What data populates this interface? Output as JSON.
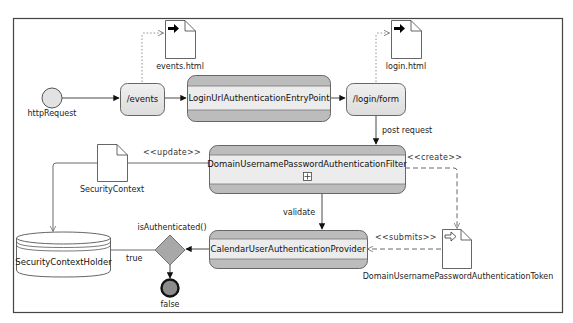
{
  "diagram": {
    "type": "UML activity diagram",
    "colors": {
      "frame": "#444444",
      "node_fill": "#e6e6e6",
      "band_fill": "#b8b8b8",
      "node_stroke": "#666666",
      "edge": "#333333",
      "decision_fill": "#a8a8a8",
      "final_fill": "#8c8c8c",
      "initial_fill": "#e0e0e0"
    },
    "nodes": {
      "initial": {
        "label": "httpRequest"
      },
      "events": {
        "label": "/events"
      },
      "entry_point": {
        "label": "LoginUrlAuthenticationEntryPoint"
      },
      "login_form": {
        "label": "/login/form"
      },
      "events_html": {
        "label": "events.html",
        "icon": "file-arrow-icon"
      },
      "login_html": {
        "label": "login.html",
        "icon": "file-arrow-icon"
      },
      "filter": {
        "label": "DomainUsernamePasswordAuthenticationFilter",
        "expand_icon": "plus-box-icon"
      },
      "security_context": {
        "label": "SecurityContext",
        "icon": "file-icon"
      },
      "security_context_holder": {
        "label": "SecurityContextHolder",
        "icon": "database-icon"
      },
      "provider": {
        "label": "CalendarUserAuthenticationProvider"
      },
      "token": {
        "label": "DomainUsernamePasswordAuthenticationToken",
        "icon": "file-hollow-arrow-icon"
      },
      "decision": {
        "label": "isAuthenticated()"
      },
      "final": {
        "label": "false"
      }
    },
    "edges": {
      "post_request": "post request",
      "update": "<<update>>",
      "create": "<<create>>",
      "validate": "validate",
      "submits": "<<submits>>",
      "true_branch": "true"
    }
  }
}
